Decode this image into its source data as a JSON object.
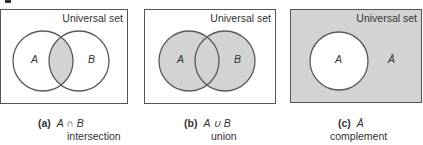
{
  "figure": {
    "colors": {
      "shade": "#d3d3d3",
      "stroke": "#5a5a5a",
      "border": "#555555"
    },
    "panels": [
      {
        "id": "a",
        "universal_label": "Universal set",
        "set_a_label": "A",
        "set_b_label": "B",
        "caption_tag": "(a)",
        "caption_expr": "A ∩ B",
        "caption_name": "intersection"
      },
      {
        "id": "b",
        "universal_label": "Universal set",
        "set_a_label": "A",
        "set_b_label": "B",
        "caption_tag": "(b)",
        "caption_expr": "A ∪ B",
        "caption_name": "union"
      },
      {
        "id": "c",
        "universal_label": "Universal set",
        "set_a_label": "A",
        "complement_label": "Ā",
        "caption_tag": "(c)",
        "caption_expr": "Ā",
        "caption_name": "complement"
      }
    ]
  }
}
